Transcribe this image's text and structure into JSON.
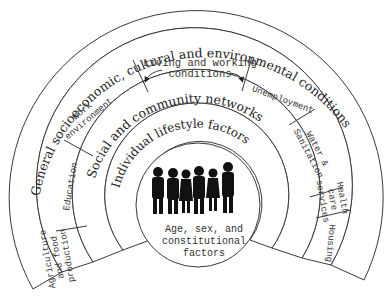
{
  "diagram": {
    "layers": {
      "outer": "General socioeconomic, cultural and environmental conditions",
      "living_working": "Living and working conditions",
      "social": "Social and community networks",
      "lifestyle": "Individual lifestyle factors",
      "core": [
        "Age, sex, and",
        "constitutional",
        "factors"
      ]
    },
    "sectors": {
      "agriculture": [
        "Agriculture",
        "and food",
        "production"
      ],
      "education": "Education",
      "work_environment": [
        "Work",
        "environment"
      ],
      "unemployment": "Unemployment",
      "water": [
        "Water &",
        "Sanitation"
      ],
      "health": [
        "Health",
        "care",
        "services"
      ],
      "housing": "Housing"
    },
    "colors": {
      "stroke": "#3a3a3a",
      "text": "#222222",
      "figures": "#111111",
      "background": "#ffffff"
    }
  }
}
